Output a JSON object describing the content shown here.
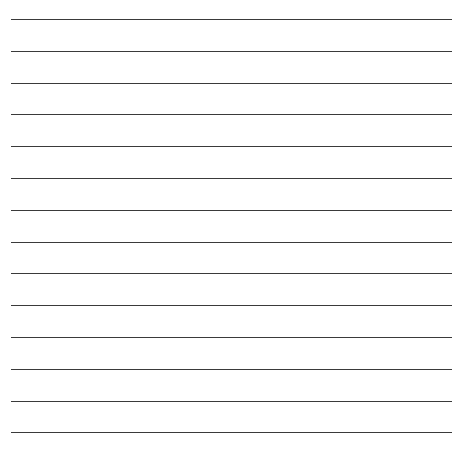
{
  "paper": {
    "type": "lined-paper",
    "background": "#ffffff",
    "line_color": "#3a3a3a",
    "line_count": 14,
    "first_line_y": 19,
    "line_spacing": 31.8,
    "line_left": 11,
    "line_right": 452
  }
}
